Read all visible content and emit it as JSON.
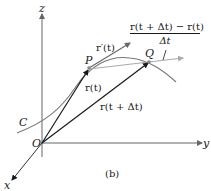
{
  "figure": {
    "caption": "(b)",
    "axes": {
      "z": "z",
      "y": "y",
      "x": "x",
      "origin": "O"
    },
    "points": {
      "P": "P",
      "Q": "Q"
    },
    "curve_label": "C",
    "vectors": {
      "r_t": "r(t)",
      "r_t_dt": "r(t + Δt)",
      "r_prime": "r′(t)"
    },
    "difference_quotient": {
      "numerator": "r(t + Δt) − r(t)",
      "denominator": "Δt"
    },
    "colors": {
      "axes": "#555555",
      "vectors": "#1a1a1a",
      "curve": "#777777",
      "secant": "#aaaaaa",
      "tangent": "#666666"
    }
  }
}
